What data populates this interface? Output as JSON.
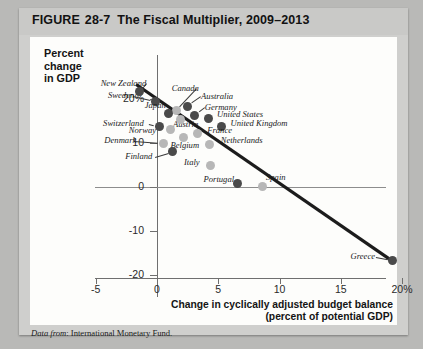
{
  "figure": {
    "label": "FIGURE",
    "number": "28-7",
    "title": "The Fiscal Multiplier, 2009–2013",
    "source_prefix": "Data from",
    "source": "International Monetary Fund."
  },
  "chart_data": {
    "type": "scatter",
    "title": "The Fiscal Multiplier, 2009–2013",
    "xlabel": "Change in cyclically adjusted budget balance (percent of potential GDP)",
    "xlabel_line1": "Change in cyclically adjusted budget balance",
    "xlabel_line2": "(percent of potential GDP)",
    "ylabel": "Percent change in GDP",
    "ylabel_line1": "Percent",
    "ylabel_line2": "change",
    "ylabel_line3": "in GDP",
    "xlim": [
      -5,
      20
    ],
    "ylim": [
      -20,
      24
    ],
    "grid": false,
    "legend": "none",
    "xticks": [
      "-5",
      "0",
      "5",
      "10",
      "15",
      "20%"
    ],
    "xtick_values": [
      -5,
      0,
      5,
      10,
      15,
      20
    ],
    "yticks": [
      "20%",
      "10",
      "0",
      "-10",
      "-20"
    ],
    "ytick_values": [
      20,
      10,
      0,
      -10,
      -20
    ],
    "points": [
      {
        "label": "New Zealand",
        "x": -1.4,
        "y": 21.5,
        "color": "dark",
        "lx": -4.6,
        "ly": 23.4
      },
      {
        "label": "Sweden",
        "x": -0.1,
        "y": 19.4,
        "color": "dark",
        "lx": -4.0,
        "ly": 20.6
      },
      {
        "label": "Canada",
        "x": 1.6,
        "y": 17.3,
        "color": "light",
        "lx": 1.2,
        "ly": 22.2
      },
      {
        "label": "Australia",
        "x": 2.5,
        "y": 18.2,
        "color": "dark",
        "lx": 3.6,
        "ly": 20.3
      },
      {
        "label": "Germany",
        "x": 3.1,
        "y": 16.1,
        "color": "dark",
        "lx": 3.9,
        "ly": 17.8
      },
      {
        "label": "Japan",
        "x": 0.9,
        "y": 16.6,
        "color": "dark",
        "lx": -1.0,
        "ly": 18.4
      },
      {
        "label": "Austria",
        "x": 1.9,
        "y": 15.3,
        "color": "light",
        "lx": 1.3,
        "ly": 14.0
      },
      {
        "label": "United States",
        "x": 4.2,
        "y": 15.6,
        "color": "dark",
        "lx": 4.9,
        "ly": 16.2
      },
      {
        "label": "United Kingdom",
        "x": 5.3,
        "y": 13.6,
        "color": "dark",
        "lx": 6.0,
        "ly": 14.2
      },
      {
        "label": "Switzerland",
        "x": 0.2,
        "y": 13.6,
        "color": "dark",
        "lx": -4.4,
        "ly": 14.2
      },
      {
        "label": "Norway",
        "x": 1.1,
        "y": 13.0,
        "color": "light",
        "lx": -2.3,
        "ly": 12.7
      },
      {
        "label": "France",
        "x": 3.3,
        "y": 12.1,
        "color": "light",
        "lx": 4.1,
        "ly": 12.6
      },
      {
        "label": "Belgium",
        "x": 2.2,
        "y": 11.2,
        "color": "light",
        "lx": 1.1,
        "ly": 9.2
      },
      {
        "label": "Netherlands",
        "x": 4.3,
        "y": 9.6,
        "color": "light",
        "lx": 5.2,
        "ly": 10.3
      },
      {
        "label": "Denmark",
        "x": 0.5,
        "y": 9.8,
        "color": "light",
        "lx": -4.3,
        "ly": 10.3
      },
      {
        "label": "Finland",
        "x": 1.3,
        "y": 8.0,
        "color": "dark",
        "lx": -2.6,
        "ly": 6.8
      },
      {
        "label": "Italy",
        "x": 4.4,
        "y": 4.8,
        "color": "light",
        "lx": 2.2,
        "ly": 5.4
      },
      {
        "label": "Portugal",
        "x": 6.6,
        "y": 0.9,
        "color": "dark",
        "lx": 3.8,
        "ly": 1.5
      },
      {
        "label": "Spain",
        "x": 8.6,
        "y": 0.2,
        "color": "light",
        "lx": 8.9,
        "ly": 2.1
      },
      {
        "label": "Greece",
        "x": 19.2,
        "y": -16.6,
        "color": "dark",
        "lx": 15.8,
        "ly": -15.9
      }
    ],
    "trendline": {
      "x1": -1.7,
      "y1": 23.2,
      "x2": 19.4,
      "y2": -17.1,
      "color": "#1c1c1c"
    }
  }
}
